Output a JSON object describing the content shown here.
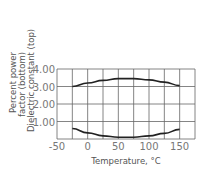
{
  "chart_data": {
    "type": "line",
    "title": "",
    "xlabel": "Temperature, °C",
    "ylabel_lines": [
      "Percent power",
      "factor (bottom)",
      "Dielectric constant (top)"
    ],
    "xlim": [
      -50,
      175
    ],
    "ylim": [
      0,
      4
    ],
    "x_ticks": [
      -50,
      0,
      50,
      100,
      150
    ],
    "y_ticks": [
      1.0,
      2.0,
      3.0,
      4.0
    ],
    "y_tick_labels": [
      "1.00",
      "2.00",
      "3.00",
      "4.00"
    ],
    "grid": true,
    "x_grid_step": 25,
    "y_grid_step": 1,
    "legend": null,
    "series": [
      {
        "name": "Dielectric constant (top)",
        "x": [
          -25,
          0,
          25,
          50,
          75,
          100,
          125,
          150
        ],
        "y": [
          3.0,
          3.2,
          3.35,
          3.45,
          3.45,
          3.38,
          3.25,
          3.05
        ]
      },
      {
        "name": "Percent power factor (bottom)",
        "x": [
          -25,
          0,
          25,
          50,
          75,
          100,
          125,
          150
        ],
        "y": [
          0.6,
          0.35,
          0.18,
          0.1,
          0.1,
          0.18,
          0.32,
          0.55
        ]
      }
    ]
  }
}
